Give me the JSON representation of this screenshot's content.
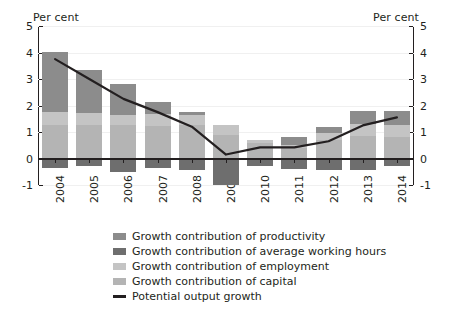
{
  "chart_data": {
    "type": "bar",
    "title": "",
    "subtitle": "",
    "xlabel": "",
    "ylabel": "Per cent",
    "ylabel_right": "Per cent",
    "ylim": [
      -1,
      5
    ],
    "yticks": [
      5,
      4,
      3,
      2,
      1,
      0,
      -1
    ],
    "ytick_labels": [
      "5",
      "4",
      "3",
      "2",
      "1",
      "0",
      "-1"
    ],
    "grid": true,
    "stacked": true,
    "legend_position": "bottom",
    "categories": [
      "2004",
      "2005",
      "2006",
      "2007",
      "2008",
      "2009",
      "2010",
      "2011",
      "2012",
      "2013",
      "2014"
    ],
    "series": [
      {
        "name": "Growth contribution of productivity",
        "color": "#8c8c8c",
        "values": [
          2.27,
          1.65,
          1.17,
          0.47,
          0.1,
          0.0,
          0.0,
          0.3,
          0.25,
          0.5,
          0.55
        ]
      },
      {
        "name": "Growth contribution of average working hours",
        "color": "#6e6e6e",
        "values": [
          -0.35,
          -0.3,
          -0.5,
          -0.35,
          -0.45,
          -1.0,
          -0.3,
          -0.4,
          -0.45,
          -0.45,
          -0.3
        ]
      },
      {
        "name": "Growth contribution of employment",
        "color": "#c4c4c4",
        "values": [
          0.5,
          0.45,
          0.4,
          0.45,
          0.4,
          0.35,
          0.1,
          0.1,
          0.25,
          0.45,
          0.45
        ]
      },
      {
        "name": "Growth contribution of capital",
        "color": "#b4b4b4",
        "values": [
          1.25,
          1.25,
          1.25,
          1.22,
          1.25,
          0.9,
          0.6,
          0.4,
          0.7,
          0.85,
          0.8
        ]
      }
    ],
    "line_series": {
      "name": "Potential output growth",
      "color": "#231f20",
      "values": [
        3.75,
        3.0,
        2.25,
        1.75,
        1.2,
        0.15,
        0.42,
        0.42,
        0.65,
        1.25,
        1.55
      ]
    },
    "bar_totals": [
      4.02,
      3.35,
      2.82,
      2.14,
      1.75,
      1.25,
      0.7,
      0.8,
      1.2,
      1.8,
      1.8
    ]
  },
  "legend": {
    "items": [
      {
        "label": "Growth contribution of productivity",
        "color": "#8c8c8c",
        "type": "swatch"
      },
      {
        "label": "Growth contribution of average working hours",
        "color": "#6e6e6e",
        "type": "swatch"
      },
      {
        "label": "Growth contribution of employment",
        "color": "#c4c4c4",
        "type": "swatch"
      },
      {
        "label": "Growth contribution of capital",
        "color": "#b4b4b4",
        "type": "swatch"
      },
      {
        "label": "Potential output growth",
        "color": "#231f20",
        "type": "line"
      }
    ]
  },
  "axis": {
    "left_unit": "Per cent",
    "right_unit": "Per cent"
  }
}
